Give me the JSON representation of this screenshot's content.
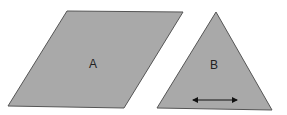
{
  "shapes": {
    "parallelogram": {
      "label": "A",
      "fill": "#a9a9a9",
      "stroke": "#555555"
    },
    "triangle": {
      "label": "B",
      "fill": "#a9a9a9",
      "stroke": "#555555",
      "base_arrow": "double-headed arrow along base"
    }
  }
}
